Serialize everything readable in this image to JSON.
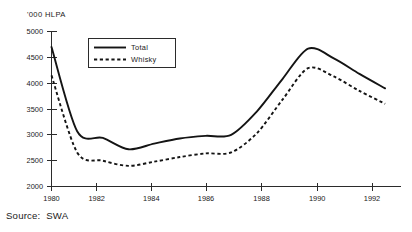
{
  "chart_data": {
    "type": "line",
    "title": "",
    "subtitle": "",
    "xlabel": "",
    "ylabel": "'000 HLPA",
    "x": [
      1980,
      1981,
      1982,
      1983,
      1984,
      1985,
      1986,
      1987,
      1988,
      1989,
      1990,
      1991,
      1992,
      1993
    ],
    "xlim": [
      1980,
      1993.6
    ],
    "ylim": [
      2000,
      5000
    ],
    "xticks": [
      1980,
      1982,
      1984,
      1986,
      1988,
      1990,
      1992
    ],
    "xtick_labels": [
      "1980",
      "1982",
      "1984",
      "1986",
      "1988",
      "1990",
      "1992"
    ],
    "yticks": [
      2000,
      2500,
      3000,
      3500,
      4000,
      4500,
      5000
    ],
    "ytick_labels": [
      "2000",
      "2500",
      "3000",
      "3500",
      "4000",
      "4500",
      "5000"
    ],
    "grid": false,
    "legend_position": "top-left-inside",
    "series": [
      {
        "name": "Total",
        "style": "solid",
        "color": "#141414",
        "values": [
          4700,
          3070,
          2940,
          2720,
          2830,
          2930,
          2980,
          3000,
          3450,
          4080,
          4670,
          4480,
          4180,
          3900
        ]
      },
      {
        "name": "Whisky",
        "style": "dashed",
        "color": "#141414",
        "values": [
          4150,
          2660,
          2500,
          2400,
          2480,
          2570,
          2640,
          2660,
          3030,
          3680,
          4290,
          4130,
          3850,
          3600
        ]
      }
    ]
  },
  "legend": {
    "entries": [
      {
        "label": "Total"
      },
      {
        "label": "Whisky"
      }
    ]
  },
  "axis": {
    "units_label": "'000 HLPA"
  },
  "footer": {
    "source_text": "Source:  SWA"
  }
}
